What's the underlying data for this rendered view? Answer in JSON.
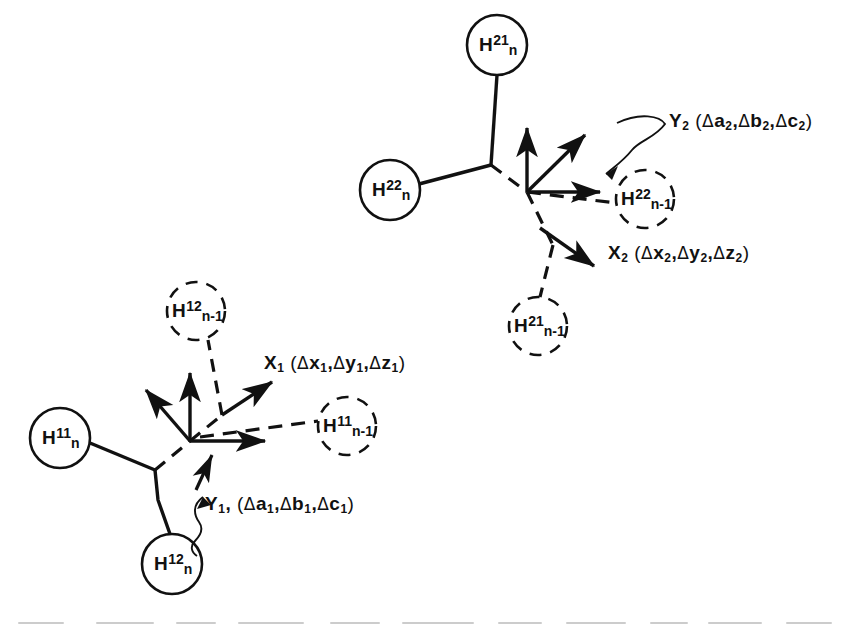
{
  "figure": {
    "type": "diagram",
    "background_color": "#ffffff",
    "ink_color": "#111111"
  },
  "clusters": [
    {
      "id": "cluster-2",
      "nodes": [
        {
          "name": "node-h21-n",
          "symbol": "H",
          "sup": "21",
          "sub": "n",
          "style": "solid",
          "cx": 497,
          "cy": 45,
          "r": 30
        },
        {
          "name": "node-h22-n",
          "symbol": "H",
          "sup": "22",
          "sub": "n",
          "style": "solid",
          "cx": 390,
          "cy": 190,
          "r": 30
        },
        {
          "name": "node-h22-n-1",
          "symbol": "H",
          "sup": "22",
          "sub": "n-1",
          "style": "dashed",
          "cx": 645,
          "cy": 199,
          "r": 29
        },
        {
          "name": "node-h21-n-1",
          "symbol": "H",
          "sup": "21",
          "sub": "n-1",
          "style": "dashed",
          "cx": 538,
          "cy": 326,
          "r": 29
        }
      ],
      "vector_labels": [
        {
          "name": "label-y2",
          "text": "Y",
          "sub": "2",
          "args": "( Δa2 , Δb2 , Δc2 )"
        },
        {
          "name": "label-x2",
          "text": "X",
          "sub": "2",
          "args": "( Δx2 , Δy2 , Δz2 )"
        }
      ]
    },
    {
      "id": "cluster-1",
      "nodes": [
        {
          "name": "node-h11-n",
          "symbol": "H",
          "sup": "11",
          "sub": "n",
          "style": "solid",
          "cx": 60,
          "cy": 438,
          "r": 30
        },
        {
          "name": "node-h12-n",
          "symbol": "H",
          "sup": "12",
          "sub": "n",
          "style": "solid",
          "cx": 172,
          "cy": 564,
          "r": 30
        },
        {
          "name": "node-h12-n-1",
          "symbol": "H",
          "sup": "12",
          "sub": "n-1",
          "style": "dashed",
          "cx": 196,
          "cy": 311,
          "r": 29
        },
        {
          "name": "node-h11-n-1",
          "symbol": "H",
          "sup": "11",
          "sub": "n-1",
          "style": "dashed",
          "cx": 347,
          "cy": 426,
          "r": 29
        }
      ],
      "vector_labels": [
        {
          "name": "label-x1",
          "text": "X",
          "sub": "1",
          "args": "( Δx1 , Δy1 , Δz1 )"
        },
        {
          "name": "label-y1",
          "text": "Y",
          "sub": "1",
          "args": ", ( Δa1 , Δb1 , Δc1 )"
        }
      ]
    }
  ],
  "labels": {
    "y2_name": "Y",
    "y2_sub": "2",
    "y2_open": "(",
    "y2_a": "a",
    "y2_b": "b",
    "y2_c": "c",
    "x2_name": "X",
    "x2_sub": "2",
    "x2_open": "(",
    "x2_x": "x",
    "x2_y": "y",
    "x2_z": "z",
    "x1_name": "X",
    "x1_sub": "1",
    "x1_open": "(",
    "x1_x": "x",
    "x1_y": "y",
    "x1_z": "z",
    "y1_name": "Y",
    "y1_sub": "1",
    "y1_comma": ",",
    "y1_open": "(",
    "y1_a": "a",
    "y1_b": "b",
    "y1_c": "c",
    "delta": "Δ",
    "comma": ",",
    "close": ")",
    "sub1": "1",
    "sub2": "2"
  },
  "node_text": {
    "h": "H",
    "sup21": "21",
    "sup22": "22",
    "sup11": "11",
    "sup12": "12",
    "sub_n": "n",
    "sub_nm1": "n-1"
  }
}
